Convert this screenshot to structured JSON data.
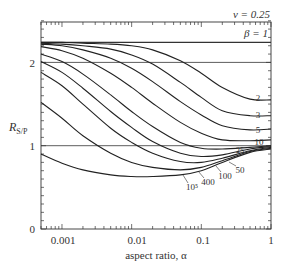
{
  "chart_data": {
    "type": "line",
    "title": "",
    "annotation_top": "ν = 0.25",
    "xlabel": "aspect ratio, α",
    "ylabel": "R_S/P",
    "xscale": "log",
    "xlim": [
      0.0005,
      1
    ],
    "ylim": [
      0,
      2.7
    ],
    "x_ticks": [
      "0.001",
      "0.01",
      "0.1",
      "1"
    ],
    "y_ticks": [
      "0",
      "1",
      "2"
    ],
    "grid": false,
    "reference_lines": [
      {
        "name": "β = 1",
        "y": 2.24
      },
      {
        "name": "y=2",
        "y": 2.0
      },
      {
        "name": "y=1",
        "y": 1.0
      }
    ],
    "x": [
      0.0005,
      0.001,
      0.002,
      0.005,
      0.01,
      0.02,
      0.05,
      0.1,
      0.2,
      0.5,
      1
    ],
    "series": [
      {
        "name": "β=2",
        "label": "2",
        "values": [
          2.24,
          2.24,
          2.23,
          2.22,
          2.2,
          2.15,
          2.02,
          1.87,
          1.7,
          1.56,
          1.55
        ]
      },
      {
        "name": "β=3",
        "label": "3",
        "values": [
          2.23,
          2.22,
          2.2,
          2.16,
          2.09,
          1.98,
          1.76,
          1.58,
          1.42,
          1.36,
          1.36
        ]
      },
      {
        "name": "β=5",
        "label": "5",
        "values": [
          2.22,
          2.2,
          2.15,
          2.05,
          1.93,
          1.77,
          1.53,
          1.37,
          1.24,
          1.19,
          1.2
        ]
      },
      {
        "name": "β=10",
        "label": "10",
        "values": [
          2.19,
          2.14,
          2.05,
          1.87,
          1.7,
          1.51,
          1.28,
          1.15,
          1.07,
          1.06,
          1.07
        ]
      },
      {
        "name": "β=25",
        "label": "25",
        "values": [
          2.1,
          2.01,
          1.86,
          1.61,
          1.41,
          1.23,
          1.04,
          0.97,
          0.96,
          0.98,
          1.0
        ]
      },
      {
        "name": "β=50",
        "label": "50",
        "values": [
          2.01,
          1.88,
          1.69,
          1.41,
          1.22,
          1.05,
          0.91,
          0.87,
          0.89,
          0.96,
          0.99
        ]
      },
      {
        "name": "β=100",
        "label": "100",
        "values": [
          1.88,
          1.72,
          1.5,
          1.21,
          1.04,
          0.91,
          0.81,
          0.8,
          0.85,
          0.94,
          0.98
        ]
      },
      {
        "name": "β=400",
        "label": "400",
        "values": [
          1.52,
          1.33,
          1.12,
          0.91,
          0.8,
          0.74,
          0.71,
          0.74,
          0.82,
          0.93,
          0.97
        ]
      },
      {
        "name": "β=10^5",
        "label": "10⁵",
        "values": [
          0.9,
          0.79,
          0.71,
          0.65,
          0.63,
          0.63,
          0.65,
          0.7,
          0.8,
          0.92,
          0.96
        ]
      }
    ]
  },
  "labels": {
    "nu": "ν = 0.25",
    "beta": "β = 1",
    "ylabel_main": "R",
    "ylabel_sub": "S/P",
    "xlabel": "aspect ratio, α",
    "xticks": [
      "0.001",
      "0.01",
      "0.1",
      "1"
    ],
    "yticks": [
      "0",
      "1",
      "2"
    ],
    "curve_labels_right": [
      "2",
      "3",
      "5",
      "10",
      "25"
    ],
    "curve_labels_bottom": [
      "50",
      "100",
      "400",
      "10⁵"
    ]
  }
}
